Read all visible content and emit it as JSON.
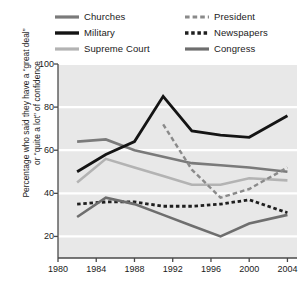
{
  "chart_data": {
    "type": "line",
    "title": "",
    "xlabel": "",
    "ylabel": "Percentage who said they have a “great deal” or “quite a lot” of confidence",
    "ylabel_line1": "Percentage who said they have a “great deal”",
    "ylabel_line2": "or “quite a lot” of confidence",
    "xlim": [
      1980,
      2005
    ],
    "ylim": [
      10,
      100
    ],
    "xticks": [
      1980,
      1984,
      1988,
      1992,
      1996,
      2000,
      2004
    ],
    "yticks": [
      20,
      40,
      60,
      80,
      100
    ],
    "grid": "horizontal-white-on-gray",
    "plot_background": "#e8e8e8",
    "gridline_color": "#ffffff",
    "legend_position": "above-plot",
    "legend_columns": 2,
    "series": [
      {
        "name": "Churches",
        "color": "#7a7a7a",
        "dash": "solid",
        "width": 2.6,
        "x": [
          1982,
          1985,
          1988,
          1991,
          1994,
          1997,
          2000,
          2004
        ],
        "values": [
          64,
          65,
          60,
          57,
          54,
          53,
          52,
          50
        ]
      },
      {
        "name": "Military",
        "color": "#141414",
        "dash": "solid",
        "width": 2.8,
        "x": [
          1982,
          1985,
          1988,
          1991,
          1994,
          1997,
          2000,
          2004
        ],
        "values": [
          50,
          58,
          64,
          85,
          69,
          67,
          66,
          76
        ]
      },
      {
        "name": "Supreme Court",
        "color": "#b3b3b3",
        "dash": "solid",
        "width": 2.6,
        "x": [
          1982,
          1985,
          1988,
          1991,
          1994,
          1997,
          2000,
          2004
        ],
        "values": [
          45,
          56,
          52,
          48,
          44,
          44,
          47,
          46
        ]
      },
      {
        "name": "President",
        "color": "#8a8a8a",
        "dash": "dashed",
        "width": 2.4,
        "x": [
          1991,
          1994,
          1997,
          2000,
          2004
        ],
        "values": [
          72,
          51,
          38,
          42,
          52
        ]
      },
      {
        "name": "Newspapers",
        "color": "#1f1f1f",
        "dash": "dotted-square",
        "width": 2.8,
        "x": [
          1982,
          1985,
          1988,
          1991,
          1994,
          1997,
          2000,
          2004
        ],
        "values": [
          35,
          36,
          36,
          34,
          34,
          35,
          37,
          31
        ]
      },
      {
        "name": "Congress",
        "color": "#6e6e6e",
        "dash": "solid",
        "width": 2.6,
        "x": [
          1982,
          1985,
          1988,
          1991,
          1994,
          1997,
          2000,
          2004
        ],
        "values": [
          29,
          38,
          35,
          30,
          25,
          20,
          26,
          30
        ]
      }
    ]
  },
  "legend": {
    "items": [
      {
        "label": "Churches",
        "column": 0,
        "row": 0
      },
      {
        "label": "Military",
        "column": 0,
        "row": 1
      },
      {
        "label": "Supreme Court",
        "column": 0,
        "row": 2
      },
      {
        "label": "President",
        "column": 1,
        "row": 0
      },
      {
        "label": "Newspapers",
        "column": 1,
        "row": 1
      },
      {
        "label": "Congress",
        "column": 1,
        "row": 2
      }
    ]
  },
  "axes": {
    "y_tick_labels": [
      "100",
      "80",
      "60",
      "40",
      "20"
    ],
    "x_tick_labels": [
      "1980",
      "1984",
      "1988",
      "1992",
      "1996",
      "2000",
      "2004"
    ]
  }
}
